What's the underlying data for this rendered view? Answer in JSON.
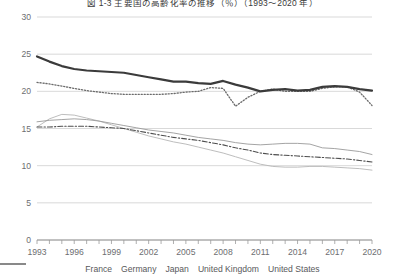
{
  "title": "図 1-3  主要国の高齢化率の推移（％）（1993～2020 年）",
  "axes": {
    "y_ticks": [
      "0",
      "5",
      "10",
      "15",
      "20",
      "25",
      "30"
    ],
    "x_ticks": [
      "1993",
      "1996",
      "1999",
      "2002",
      "2005",
      "2008",
      "2011",
      "2014",
      "2017",
      "2020"
    ],
    "ylim": [
      0,
      30
    ],
    "xlim": [
      1993,
      2020
    ],
    "grid": "horizontal"
  },
  "legend": {
    "position": "bottom-center",
    "items": [
      {
        "label": "France",
        "style": "dash-dot",
        "color": "#4d4d4d"
      },
      {
        "label": "Germany",
        "style": "dotted",
        "color": "#6b6b6b"
      },
      {
        "label": "Japan",
        "style": "thick-solid",
        "color": "#3b3b3b"
      },
      {
        "label": "United Kingdom",
        "style": "solid",
        "color": "#9a9a9a"
      },
      {
        "label": "United States",
        "style": "solid",
        "color": "#b5b5b5"
      }
    ]
  },
  "chart_data": {
    "type": "line",
    "title": "図 1-3  主要国の高齢化率の推移（％）（1993～2020 年）",
    "xlabel": "",
    "ylabel": "",
    "ylim": [
      0,
      30
    ],
    "grid": true,
    "legend_position": "bottom",
    "x": [
      1993,
      1994,
      1995,
      1996,
      1997,
      1998,
      1999,
      2000,
      2001,
      2002,
      2003,
      2004,
      2005,
      2006,
      2007,
      2008,
      2009,
      2010,
      2011,
      2012,
      2013,
      2014,
      2015,
      2016,
      2017,
      2018,
      2019,
      2020
    ],
    "series": [
      {
        "name": "Japan",
        "style": "thick-solid",
        "color": "#3b3b3b",
        "values": [
          24.7,
          24.0,
          23.4,
          23.0,
          22.8,
          22.7,
          22.6,
          22.5,
          22.2,
          21.9,
          21.6,
          21.3,
          21.3,
          21.1,
          21.0,
          21.4,
          20.9,
          20.5,
          20.0,
          20.2,
          20.3,
          20.1,
          20.2,
          20.6,
          20.7,
          20.6,
          20.3,
          20.1
        ]
      },
      {
        "name": "Germany",
        "style": "dotted",
        "color": "#6b6b6b",
        "values": [
          21.2,
          21.0,
          20.7,
          20.4,
          20.1,
          19.9,
          19.7,
          19.6,
          19.6,
          19.6,
          19.6,
          19.7,
          19.9,
          20.0,
          20.5,
          20.4,
          18.0,
          19.2,
          20.0,
          20.3,
          20.0,
          20.0,
          20.0,
          20.4,
          20.6,
          20.6,
          19.9,
          18.1
        ]
      },
      {
        "name": "United Kingdom",
        "style": "solid",
        "color": "#9a9a9a",
        "values": [
          15.9,
          16.1,
          16.2,
          16.3,
          16.2,
          16.0,
          15.7,
          15.4,
          15.1,
          14.8,
          14.6,
          14.4,
          14.1,
          13.8,
          13.6,
          13.4,
          13.1,
          12.9,
          12.8,
          12.9,
          13.0,
          13.0,
          12.9,
          12.4,
          12.3,
          12.1,
          11.9,
          11.5
        ]
      },
      {
        "name": "France",
        "style": "dash-dot",
        "color": "#4d4d4d",
        "values": [
          15.2,
          15.2,
          15.3,
          15.3,
          15.3,
          15.2,
          15.1,
          15.0,
          14.7,
          14.4,
          14.1,
          13.8,
          13.6,
          13.4,
          13.1,
          12.8,
          12.4,
          12.1,
          11.7,
          11.5,
          11.4,
          11.3,
          11.2,
          11.1,
          11.0,
          10.9,
          10.7,
          10.5
        ]
      },
      {
        "name": "United States",
        "style": "solid",
        "color": "#b5b5b5",
        "values": [
          15.2,
          16.3,
          16.9,
          16.8,
          16.4,
          16.0,
          15.5,
          15.0,
          14.5,
          14.0,
          13.6,
          13.2,
          12.9,
          12.5,
          12.1,
          11.7,
          11.2,
          10.7,
          10.2,
          9.9,
          9.8,
          9.8,
          9.9,
          9.9,
          9.8,
          9.7,
          9.6,
          9.4
        ]
      }
    ]
  }
}
